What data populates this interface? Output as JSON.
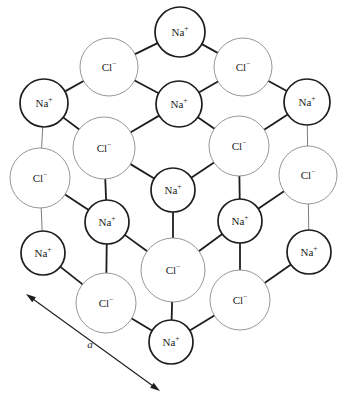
{
  "figure": {
    "dimension_label": "a",
    "colors": {
      "background": "#ffffff",
      "cation_stroke": "#1d1d1d",
      "anion_stroke": "#8a8a8a",
      "bond_thick": "#1d1d1d",
      "bond_thin": "#6e6e6e",
      "text": "#1a1a1a"
    },
    "species": [
      {
        "key": "na",
        "base": "Na",
        "charge": "+",
        "name": "sodium-ion",
        "radius": 22,
        "style": "cation"
      },
      {
        "key": "cl",
        "base": "Cl",
        "charge": "−",
        "name": "chloride-ion",
        "radius": 30,
        "style": "anion"
      }
    ],
    "ions": [
      {
        "id": "na-top",
        "species": "na",
        "base": "Na",
        "charge": "+",
        "cx": 180,
        "cy": 32,
        "r": 25,
        "style": "cation"
      },
      {
        "id": "cl-top-left",
        "species": "cl",
        "base": "Cl",
        "charge": "−",
        "cx": 109,
        "cy": 67,
        "r": 29,
        "style": "anion"
      },
      {
        "id": "cl-top-right",
        "species": "cl",
        "base": "Cl",
        "charge": "−",
        "cx": 243,
        "cy": 67,
        "r": 29,
        "style": "anion"
      },
      {
        "id": "na-left-upper",
        "species": "na",
        "base": "Na",
        "charge": "+",
        "cx": 44,
        "cy": 103,
        "r": 24,
        "style": "cation"
      },
      {
        "id": "na-center-upper",
        "species": "na",
        "base": "Na",
        "charge": "+",
        "cx": 179,
        "cy": 104,
        "r": 23,
        "style": "cation"
      },
      {
        "id": "na-right-upper",
        "species": "na",
        "base": "Na",
        "charge": "+",
        "cx": 307,
        "cy": 102,
        "r": 23,
        "style": "cation"
      },
      {
        "id": "cl-mid-left",
        "species": "cl",
        "base": "Cl",
        "charge": "−",
        "cx": 104,
        "cy": 148,
        "r": 31,
        "style": "anion"
      },
      {
        "id": "cl-mid-right",
        "species": "cl",
        "base": "Cl",
        "charge": "−",
        "cx": 239,
        "cy": 146,
        "r": 30,
        "style": "anion"
      },
      {
        "id": "cl-far-left",
        "species": "cl",
        "base": "Cl",
        "charge": "−",
        "cx": 40,
        "cy": 178,
        "r": 30,
        "style": "anion"
      },
      {
        "id": "cl-far-right",
        "species": "cl",
        "base": "Cl",
        "charge": "−",
        "cx": 308,
        "cy": 175,
        "r": 29,
        "style": "anion"
      },
      {
        "id": "na-center-mid",
        "species": "na",
        "base": "Na",
        "charge": "+",
        "cx": 173,
        "cy": 190,
        "r": 22,
        "style": "cation"
      },
      {
        "id": "na-lower-left",
        "species": "na",
        "base": "Na",
        "charge": "+",
        "cx": 107,
        "cy": 222,
        "r": 22,
        "style": "cation"
      },
      {
        "id": "na-lower-right",
        "species": "na",
        "base": "Na",
        "charge": "+",
        "cx": 240,
        "cy": 221,
        "r": 22,
        "style": "cation"
      },
      {
        "id": "na-far-left-low",
        "species": "na",
        "base": "Na",
        "charge": "+",
        "cx": 43,
        "cy": 253,
        "r": 22,
        "style": "cation"
      },
      {
        "id": "na-far-right-low",
        "species": "na",
        "base": "Na",
        "charge": "+",
        "cx": 309,
        "cy": 252,
        "r": 22,
        "style": "cation"
      },
      {
        "id": "cl-center-front",
        "species": "cl",
        "base": "Cl",
        "charge": "−",
        "cx": 173,
        "cy": 270,
        "r": 32,
        "style": "anion"
      },
      {
        "id": "cl-bottom-left",
        "species": "cl",
        "base": "Cl",
        "charge": "−",
        "cx": 106,
        "cy": 303,
        "r": 30,
        "style": "anion"
      },
      {
        "id": "cl-bottom-right",
        "species": "cl",
        "base": "Cl",
        "charge": "−",
        "cx": 240,
        "cy": 300,
        "r": 30,
        "style": "anion"
      },
      {
        "id": "na-bottom",
        "species": "na",
        "base": "Na",
        "charge": "+",
        "cx": 171,
        "cy": 342,
        "r": 22,
        "style": "cation"
      }
    ],
    "bonds": [
      {
        "from": "na-top",
        "to": "cl-top-left",
        "weight": "thick"
      },
      {
        "from": "na-top",
        "to": "cl-top-right",
        "weight": "thick"
      },
      {
        "from": "cl-top-left",
        "to": "na-left-upper",
        "weight": "thick"
      },
      {
        "from": "cl-top-left",
        "to": "na-center-upper",
        "weight": "thick"
      },
      {
        "from": "cl-top-right",
        "to": "na-center-upper",
        "weight": "thick"
      },
      {
        "from": "cl-top-right",
        "to": "na-right-upper",
        "weight": "thick"
      },
      {
        "from": "na-left-upper",
        "to": "cl-far-left",
        "weight": "thin"
      },
      {
        "from": "na-left-upper",
        "to": "cl-mid-left",
        "weight": "thick"
      },
      {
        "from": "na-center-upper",
        "to": "cl-mid-left",
        "weight": "thick"
      },
      {
        "from": "na-center-upper",
        "to": "cl-mid-right",
        "weight": "thick"
      },
      {
        "from": "na-right-upper",
        "to": "cl-mid-right",
        "weight": "thick"
      },
      {
        "from": "na-right-upper",
        "to": "cl-far-right",
        "weight": "thin"
      },
      {
        "from": "cl-mid-left",
        "to": "na-center-mid",
        "weight": "thick"
      },
      {
        "from": "cl-mid-left",
        "to": "na-lower-left",
        "weight": "thick"
      },
      {
        "from": "cl-mid-right",
        "to": "na-center-mid",
        "weight": "thick"
      },
      {
        "from": "cl-mid-right",
        "to": "na-lower-right",
        "weight": "thick"
      },
      {
        "from": "cl-far-left",
        "to": "na-lower-left",
        "weight": "thick"
      },
      {
        "from": "cl-far-left",
        "to": "na-far-left-low",
        "weight": "thin"
      },
      {
        "from": "cl-far-right",
        "to": "na-lower-right",
        "weight": "thick"
      },
      {
        "from": "cl-far-right",
        "to": "na-far-right-low",
        "weight": "thin"
      },
      {
        "from": "na-center-mid",
        "to": "cl-center-front",
        "weight": "thick"
      },
      {
        "from": "na-lower-left",
        "to": "cl-center-front",
        "weight": "thick"
      },
      {
        "from": "na-lower-left",
        "to": "cl-bottom-left",
        "weight": "thick"
      },
      {
        "from": "na-lower-right",
        "to": "cl-center-front",
        "weight": "thick"
      },
      {
        "from": "na-lower-right",
        "to": "cl-bottom-right",
        "weight": "thick"
      },
      {
        "from": "na-far-left-low",
        "to": "cl-bottom-left",
        "weight": "thick"
      },
      {
        "from": "na-far-right-low",
        "to": "cl-bottom-right",
        "weight": "thick"
      },
      {
        "from": "cl-center-front",
        "to": "na-bottom",
        "weight": "thick"
      },
      {
        "from": "cl-bottom-left",
        "to": "na-bottom",
        "weight": "thick"
      },
      {
        "from": "cl-bottom-right",
        "to": "na-bottom",
        "weight": "thick"
      }
    ],
    "dimension_arrow": {
      "x1": 26,
      "y1": 294,
      "x2": 160,
      "y2": 391,
      "label": "a",
      "label_x": 90,
      "label_y": 345
    }
  }
}
